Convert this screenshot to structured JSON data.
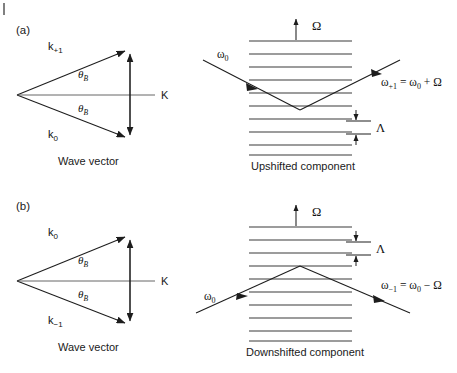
{
  "figure": {
    "background_color": "#ffffff",
    "line_color": "#2b2b2b",
    "width": 457,
    "height": 373
  },
  "panels": [
    {
      "tag": "(a)",
      "wave_vector_diagram": {
        "caption": "Wave vector",
        "incident_label": "k",
        "incident_subscript": "+1",
        "second_label": "k",
        "second_subscript": "0",
        "angle_label_upper": "θ",
        "angle_subscript_upper": "B",
        "angle_label_lower": "θ",
        "angle_subscript_lower": "B",
        "grating_vector_label": "K"
      },
      "grating_diagram": {
        "caption": "Upshifted component",
        "acoustic_label": "Ω",
        "incident_wave_label": "ω",
        "incident_wave_subscript": "0",
        "diffracted_expression": "ω₊₁ = ω₀ + Ω",
        "diffracted_symbol": "ω",
        "diffracted_subscript": "+1",
        "diffracted_rhs_symbol": "ω",
        "diffracted_rhs_subscript": "0",
        "diffracted_operator": "+",
        "diffracted_operand": "Ω",
        "period_label": "Λ",
        "period_marker_position": "lower",
        "grating_line_count": 10,
        "reflection_shape": "V"
      }
    },
    {
      "tag": "(b)",
      "wave_vector_diagram": {
        "caption": "Wave vector",
        "incident_label": "k",
        "incident_subscript": "0",
        "second_label": "k",
        "second_subscript": "−1",
        "angle_label_upper": "θ",
        "angle_subscript_upper": "B",
        "angle_label_lower": "θ",
        "angle_subscript_lower": "B",
        "grating_vector_label": "K"
      },
      "grating_diagram": {
        "caption": "Downshifted component",
        "acoustic_label": "Ω",
        "incident_wave_label": "ω",
        "incident_wave_subscript": "0",
        "diffracted_expression": "ω₋₁ = ω₀ − Ω",
        "diffracted_symbol": "ω",
        "diffracted_subscript": "−1",
        "diffracted_rhs_symbol": "ω",
        "diffracted_rhs_subscript": "0",
        "diffracted_operator": "−",
        "diffracted_operand": "Ω",
        "period_label": "Λ",
        "period_marker_position": "upper",
        "grating_line_count": 10,
        "reflection_shape": "Λ"
      }
    }
  ],
  "equals_sign": "="
}
